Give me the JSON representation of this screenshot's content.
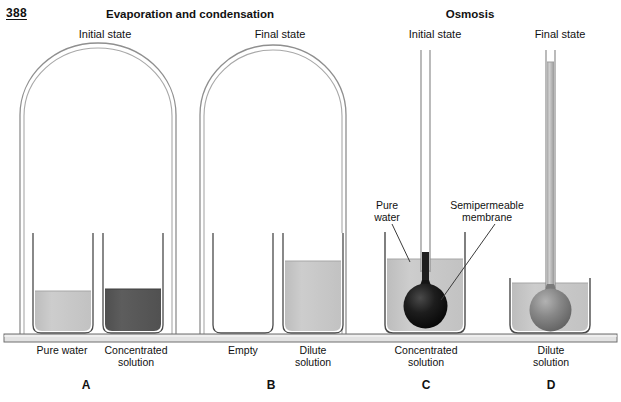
{
  "page": {
    "number": "388"
  },
  "sections": [
    {
      "id": "evaporation",
      "title": "Evaporation and condensation"
    },
    {
      "id": "osmosis",
      "title": "Osmosis"
    }
  ],
  "state_labels": {
    "evap_initial": "Initial state",
    "evap_final": "Final state",
    "osm_initial": "Initial state",
    "osm_final": "Final state"
  },
  "annotations": [
    {
      "id": "pure-water-anno",
      "text": "Pure\nwater"
    },
    {
      "id": "semipermeable-membrane-anno",
      "text": "Semipermeable\nmembrane"
    }
  ],
  "panels": [
    {
      "letter": "A",
      "section": "evaporation",
      "state": "Initial state",
      "beakers": [
        {
          "label": "Pure water",
          "fill": "light",
          "level": "low"
        },
        {
          "label": "Concentrated solution",
          "fill": "dark",
          "level": "low"
        }
      ]
    },
    {
      "letter": "B",
      "section": "evaporation",
      "state": "Final state",
      "beakers": [
        {
          "label": "Empty",
          "fill": "none",
          "level": "none"
        },
        {
          "label": "Dilute solution",
          "fill": "light",
          "level": "high"
        }
      ]
    },
    {
      "letter": "C",
      "section": "osmosis",
      "state": "Initial state",
      "beakers": [
        {
          "label": "Concentrated solution",
          "fill": "light",
          "level": "mid"
        }
      ],
      "osmometer": {
        "bulb_fill": "dark",
        "column_height": "none"
      }
    },
    {
      "letter": "D",
      "section": "osmosis",
      "state": "Final state",
      "beakers": [
        {
          "label": "Dilute solution",
          "fill": "light",
          "level": "mid"
        }
      ],
      "osmometer": {
        "bulb_fill": "medium",
        "column_height": "full"
      }
    }
  ],
  "panel_captions": {
    "a": "Pure water",
    "b": "Concentrated\nsolution",
    "c": "Empty",
    "d": "Dilute\nsolution",
    "e": "Concentrated\nsolution",
    "f": "Dilute\nsolution"
  },
  "panel_letters": {
    "a": "A",
    "b": "B",
    "c": "C",
    "d": "D"
  },
  "colors": {
    "outline": "#5a5a5a",
    "glass": "#9a9a9a",
    "liquid_light": "#c9c9c9",
    "liquid_dark": "#585858",
    "liquid_medium": "#8d8d8d",
    "bulb_dark": "#1c1c1c",
    "bulb_medium": "#7e7e7e",
    "shelf": "#d9d9d9",
    "text": "#111111"
  }
}
